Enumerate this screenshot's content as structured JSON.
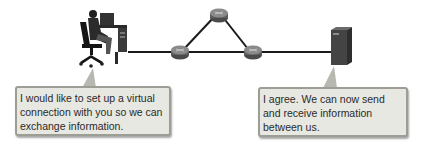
{
  "diagram": {
    "nodes": [
      {
        "id": "client",
        "type": "user-at-workstation"
      },
      {
        "id": "router-left",
        "type": "router"
      },
      {
        "id": "router-top",
        "type": "router"
      },
      {
        "id": "router-right",
        "type": "router"
      },
      {
        "id": "server",
        "type": "server"
      }
    ],
    "links": [
      [
        "client",
        "router-left"
      ],
      [
        "router-left",
        "router-top"
      ],
      [
        "router-top",
        "router-right"
      ],
      [
        "router-left",
        "router-right"
      ],
      [
        "router-right",
        "server"
      ]
    ]
  },
  "bubbles": {
    "client": {
      "lines": [
        "I would like to set up a virtual",
        "connection with you so we can",
        "exchange information."
      ]
    },
    "server": {
      "lines": [
        "I agree. We can now send",
        "and receive information",
        "between us."
      ]
    }
  },
  "colors": {
    "bubble_fill": "#e7e8e1",
    "bubble_border": "#9c9d95",
    "link": "#1a1a1a",
    "router": "#6e6e6e",
    "server": "#3d3d3d"
  }
}
